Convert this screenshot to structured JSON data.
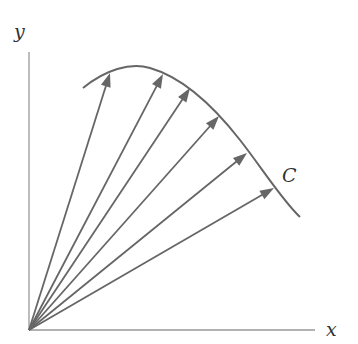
{
  "diagram": {
    "axes": {
      "x_label": "x",
      "y_label": "y",
      "origin": [
        29,
        330
      ],
      "x_end": [
        315,
        330
      ],
      "y_end": [
        29,
        52
      ]
    },
    "curve": {
      "label": "C",
      "path": "M83,88 C105,70 130,62 150,68 C185,78 215,108 240,140 C262,168 282,200 300,217"
    },
    "vectors": [
      {
        "tip": [
          110,
          73
        ]
      },
      {
        "tip": [
          163,
          74
        ]
      },
      {
        "tip": [
          190,
          88
        ]
      },
      {
        "tip": [
          219,
          116
        ]
      },
      {
        "tip": [
          247,
          153
        ]
      },
      {
        "tip": [
          274,
          188
        ]
      }
    ],
    "colors": {
      "stroke": "#666666",
      "axis": "#999999"
    }
  }
}
